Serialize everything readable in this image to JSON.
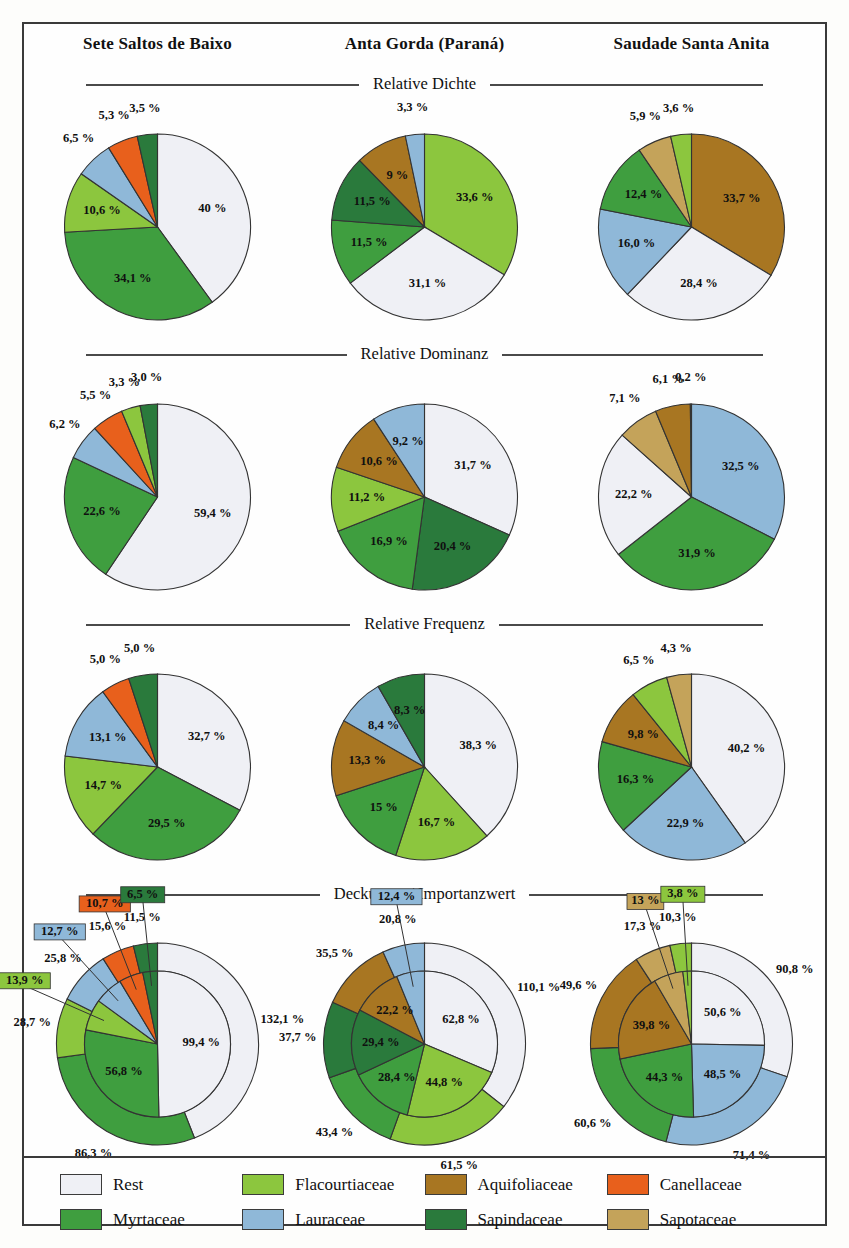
{
  "columns": [
    "Sete Saltos de Baixo",
    "Anta Gorda (Paraná)",
    "Saudade Santa Anita"
  ],
  "sections": [
    {
      "title": "Relative Dichte"
    },
    {
      "title": "Relative Dominanz"
    },
    {
      "title": "Relative Frequenz"
    },
    {
      "title": "Deckungs- / Importanzwert"
    }
  ],
  "legend": {
    "items": [
      {
        "label": "Rest",
        "color": "#eff0f5"
      },
      {
        "label": "Flacourtiaceae",
        "color": "#8cc63e"
      },
      {
        "label": "Aquifoliaceae",
        "color": "#a87622"
      },
      {
        "label": "Canellaceae",
        "color": "#e8601c"
      },
      {
        "label": "Myrtaceae",
        "color": "#3f9e3f"
      },
      {
        "label": "Lauraceae",
        "color": "#8fb8d8"
      },
      {
        "label": "Sapindaceae",
        "color": "#2a7a3c"
      },
      {
        "label": "Sapotaceae",
        "color": "#c4a35a"
      }
    ]
  },
  "chart_data": [
    {
      "type": "pie",
      "title": "Relative Dichte",
      "site": "Sete Saltos de Baixo",
      "labels": [
        "Rest",
        "Myrtaceae",
        "Flacourtiaceae",
        "Lauraceae",
        "Canellaceae",
        "Sapindaceae"
      ],
      "values": [
        40.0,
        34.1,
        10.6,
        6.5,
        5.3,
        3.5
      ],
      "value_labels": [
        "40 %",
        "34,1 %",
        "10,6 %",
        "6,5 %",
        "5,3 %",
        "3,5 %"
      ],
      "colors": [
        "#eff0f5",
        "#3f9e3f",
        "#8cc63e",
        "#8fb8d8",
        "#e8601c",
        "#2a7a3c"
      ]
    },
    {
      "type": "pie",
      "title": "Relative Dichte",
      "site": "Anta Gorda (Paraná)",
      "labels": [
        "Flacourtiaceae",
        "Rest",
        "Myrtaceae",
        "Sapindaceae",
        "Aquifoliaceae",
        "Lauraceae"
      ],
      "values": [
        33.6,
        31.1,
        11.5,
        11.5,
        9.0,
        3.3
      ],
      "value_labels": [
        "33,6 %",
        "31,1 %",
        "11,5 %",
        "11,5 %",
        "9 %",
        "3,3 %"
      ],
      "colors": [
        "#8cc63e",
        "#eff0f5",
        "#3f9e3f",
        "#2a7a3c",
        "#a87622",
        "#8fb8d8"
      ]
    },
    {
      "type": "pie",
      "title": "Relative Dichte",
      "site": "Saudade Santa Anita",
      "labels": [
        "Aquifoliaceae",
        "Rest",
        "Lauraceae",
        "Myrtaceae",
        "Sapotaceae",
        "Flacourtiaceae"
      ],
      "values": [
        33.7,
        28.4,
        16.0,
        12.4,
        5.9,
        3.6
      ],
      "value_labels": [
        "33,7 %",
        "28,4 %",
        "16,0 %",
        "12,4 %",
        "5,9 %",
        "3,6 %"
      ],
      "colors": [
        "#a87622",
        "#eff0f5",
        "#8fb8d8",
        "#3f9e3f",
        "#c4a35a",
        "#8cc63e"
      ]
    },
    {
      "type": "pie",
      "title": "Relative Dominanz",
      "site": "Sete Saltos de Baixo",
      "labels": [
        "Rest",
        "Myrtaceae",
        "Lauraceae",
        "Canellaceae",
        "Flacourtiaceae",
        "Sapindaceae"
      ],
      "values": [
        59.4,
        22.6,
        6.2,
        5.5,
        3.3,
        3.0
      ],
      "value_labels": [
        "59,4 %",
        "22,6 %",
        "6,2 %",
        "5,5 %",
        "3,3 %",
        "3,0 %"
      ],
      "colors": [
        "#eff0f5",
        "#3f9e3f",
        "#8fb8d8",
        "#e8601c",
        "#8cc63e",
        "#2a7a3c"
      ]
    },
    {
      "type": "pie",
      "title": "Relative Dominanz",
      "site": "Anta Gorda (Paraná)",
      "labels": [
        "Rest",
        "Sapindaceae",
        "Myrtaceae",
        "Flacourtiaceae",
        "Aquifoliaceae",
        "Lauraceae"
      ],
      "values": [
        31.7,
        20.4,
        16.9,
        11.2,
        10.6,
        9.2
      ],
      "value_labels": [
        "31,7 %",
        "20,4 %",
        "16,9 %",
        "11,2 %",
        "10,6 %",
        "9,2 %"
      ],
      "colors": [
        "#eff0f5",
        "#2a7a3c",
        "#3f9e3f",
        "#8cc63e",
        "#a87622",
        "#8fb8d8"
      ]
    },
    {
      "type": "pie",
      "title": "Relative Dominanz",
      "site": "Saudade Santa Anita",
      "labels": [
        "Lauraceae",
        "Myrtaceae",
        "Rest",
        "Sapotaceae",
        "Aquifoliaceae",
        "Flacourtiaceae"
      ],
      "values": [
        32.5,
        31.9,
        22.2,
        7.1,
        6.1,
        0.2
      ],
      "value_labels": [
        "32,5 %",
        "31,9 %",
        "22,2 %",
        "7,1 %",
        "6,1 %",
        "0,2 %"
      ],
      "colors": [
        "#8fb8d8",
        "#3f9e3f",
        "#eff0f5",
        "#c4a35a",
        "#a87622",
        "#8cc63e"
      ]
    },
    {
      "type": "pie",
      "title": "Relative Frequenz",
      "site": "Sete Saltos de Baixo",
      "labels": [
        "Rest",
        "Myrtaceae",
        "Flacourtiaceae",
        "Lauraceae",
        "Canellaceae",
        "Sapindaceae"
      ],
      "values": [
        32.7,
        29.5,
        14.7,
        13.1,
        5.0,
        5.0
      ],
      "value_labels": [
        "32,7 %",
        "29,5 %",
        "14,7 %",
        "13,1 %",
        "5,0 %",
        "5,0 %"
      ],
      "colors": [
        "#eff0f5",
        "#3f9e3f",
        "#8cc63e",
        "#8fb8d8",
        "#e8601c",
        "#2a7a3c"
      ]
    },
    {
      "type": "pie",
      "title": "Relative Frequenz",
      "site": "Anta Gorda (Paraná)",
      "labels": [
        "Rest",
        "Flacourtiaceae",
        "Myrtaceae",
        "Aquifoliaceae",
        "Lauraceae",
        "Sapindaceae"
      ],
      "values": [
        38.3,
        16.7,
        15.0,
        13.3,
        8.4,
        8.3
      ],
      "value_labels": [
        "38,3 %",
        "16,7 %",
        "15 %",
        "13,3 %",
        "8,4 %",
        "8,3 %"
      ],
      "colors": [
        "#eff0f5",
        "#8cc63e",
        "#3f9e3f",
        "#a87622",
        "#8fb8d8",
        "#2a7a3c"
      ]
    },
    {
      "type": "pie",
      "title": "Relative Frequenz",
      "site": "Saudade Santa Anita",
      "labels": [
        "Rest",
        "Lauraceae",
        "Myrtaceae",
        "Aquifoliaceae",
        "Flacourtiaceae",
        "Sapotaceae"
      ],
      "values": [
        40.2,
        22.9,
        16.3,
        9.8,
        6.5,
        4.3
      ],
      "value_labels": [
        "40,2 %",
        "22,9 %",
        "16,3 %",
        "9,8 %",
        "6,5 %",
        "4,3 %"
      ],
      "colors": [
        "#eff0f5",
        "#8fb8d8",
        "#3f9e3f",
        "#a87622",
        "#8cc63e",
        "#c4a35a"
      ]
    },
    {
      "type": "pie",
      "title": "Deckungs- / Importanzwert",
      "site": "Sete Saltos de Baixo",
      "labels": [
        "Rest",
        "Myrtaceae",
        "Flacourtiaceae",
        "Lauraceae",
        "Canellaceae",
        "Sapindaceae"
      ],
      "inner_values": [
        99.4,
        56.8,
        13.9,
        12.7,
        10.7,
        6.5
      ],
      "inner_labels": [
        "99,4 %",
        "56,8 %",
        "13,9 %",
        "12,7 %",
        "10,7 %",
        "6,5 %"
      ],
      "outer_values": [
        132.1,
        86.3,
        28.7,
        25.8,
        15.6,
        11.5
      ],
      "outer_labels": [
        "132,1 %",
        "86,3 %",
        "28,7 %",
        "25,8 %",
        "15,6 %",
        "11,5 %"
      ],
      "colors": [
        "#eff0f5",
        "#3f9e3f",
        "#8cc63e",
        "#8fb8d8",
        "#e8601c",
        "#2a7a3c"
      ]
    },
    {
      "type": "pie",
      "title": "Deckungs- / Importanzwert",
      "site": "Anta Gorda (Paraná)",
      "labels": [
        "Rest",
        "Flacourtiaceae",
        "Myrtaceae",
        "Sapindaceae",
        "Aquifoliaceae",
        "Lauraceae"
      ],
      "inner_values": [
        62.8,
        44.8,
        28.4,
        29.4,
        22.2,
        12.4
      ],
      "inner_labels": [
        "62,8 %",
        "44,8 %",
        "28,4 %",
        "29,4 %",
        "22,2 %",
        "12,4 %"
      ],
      "outer_values": [
        110.1,
        61.5,
        43.4,
        37.7,
        35.5,
        20.8
      ],
      "outer_labels": [
        "110,1 %",
        "61,5 %",
        "43,4 %",
        "37,7 %",
        "35,5 %",
        "20,8 %"
      ],
      "colors": [
        "#eff0f5",
        "#8cc63e",
        "#3f9e3f",
        "#2a7a3c",
        "#a87622",
        "#8fb8d8"
      ]
    },
    {
      "type": "pie",
      "title": "Deckungs- / Importanzwert",
      "site": "Saudade Santa Anita",
      "labels": [
        "Rest",
        "Lauraceae",
        "Myrtaceae",
        "Aquifoliaceae",
        "Sapotaceae",
        "Flacourtiaceae"
      ],
      "inner_values": [
        50.6,
        48.5,
        44.3,
        39.8,
        13.0,
        3.8
      ],
      "inner_labels": [
        "50,6 %",
        "48,5 %",
        "44,3 %",
        "39,8 %",
        "13 %",
        "3,8 %"
      ],
      "outer_values": [
        90.8,
        71.4,
        60.6,
        49.6,
        17.3,
        10.3
      ],
      "outer_labels": [
        "90,8 %",
        "71,4 %",
        "60,6 %",
        "49,6 %",
        "17,3 %",
        "10,3 %"
      ],
      "colors": [
        "#eff0f5",
        "#8fb8d8",
        "#3f9e3f",
        "#a87622",
        "#c4a35a",
        "#8cc63e"
      ]
    }
  ]
}
